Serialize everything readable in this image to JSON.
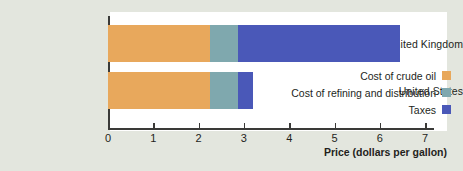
{
  "chart_data": {
    "type": "bar",
    "orientation": "horizontal",
    "stacked": true,
    "title": "",
    "xlabel": "Price (dollars per gallon)",
    "ylabel": "",
    "categories": [
      "United Kingdom",
      "United States"
    ],
    "series": [
      {
        "name": "Cost of crude oil",
        "color": "#e8a85c",
        "values": [
          2.25,
          2.25
        ]
      },
      {
        "name": "Cost of refining and distribution",
        "color": "#7fa8ae",
        "values": [
          0.62,
          0.62
        ]
      },
      {
        "name": "Taxes",
        "color": "#4a58b8",
        "values": [
          3.58,
          0.33
        ]
      }
    ],
    "totals": [
      6.45,
      3.2
    ],
    "xlim": [
      0,
      7
    ],
    "xticks": [
      0,
      1,
      2,
      3,
      4,
      5,
      6,
      7
    ],
    "xtick_labels": [
      "0",
      "1",
      "2",
      "3",
      "4",
      "5",
      "6",
      "7"
    ],
    "grid": false,
    "legend_position": "inside-right"
  },
  "legend": {
    "items": [
      {
        "label": "Cost of crude oil",
        "color": "#e8a85c"
      },
      {
        "label": "Cost of refining and distribution",
        "color": "#7fa8ae"
      },
      {
        "label": "Taxes",
        "color": "#4a58b8"
      }
    ]
  },
  "axis": {
    "x_title": "Price (dollars per gallon)"
  },
  "colors": {
    "background": "#e3e6de",
    "panel": "#ffffff",
    "axis": "#3a3a38",
    "text": "#231f1c",
    "crude_oil": "#e8a85c",
    "refining": "#7fa8ae",
    "taxes": "#4a58b8"
  }
}
